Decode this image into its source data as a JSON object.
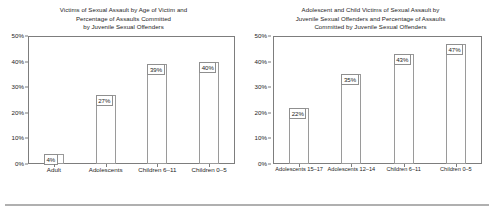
{
  "charts": [
    {
      "id": "left",
      "title": "Victims of Sexual Assault by Age of Victim and Percentage of Assaults Committed by Juvenile Sexual Offenders",
      "title_lines": [
        "Victims of Sexual Assault by Age of Victim and",
        "Percentage of Assaults Committed",
        "by Juvenile Sexual Offenders"
      ],
      "y_ticks": [
        "50%",
        "40%",
        "30%",
        "20%",
        "10%",
        "0%"
      ],
      "categories": [
        "Adult",
        "Adolescents",
        "Children 6–11",
        "Children 0–5"
      ],
      "values": [
        4,
        27,
        39,
        40
      ],
      "value_labels": [
        "4%",
        "27%",
        "39%",
        "40%"
      ]
    },
    {
      "id": "right",
      "title": "Adolescent and Child Victims of Sexual Assault by Juvenile Sexual Offenders and Percentage of Assaults Committed by Juvenile Sexual Offenders",
      "title_lines": [
        "Adolescent and Child Victims of Sexual Assault by",
        "Juvenile Sexual Offenders and Percentage of Assaults",
        "Committed by Juvenile Sexual Offenders"
      ],
      "y_ticks": [
        "50%",
        "40%",
        "30%",
        "20%",
        "10%",
        "0%"
      ],
      "categories": [
        "Adolescents 15–17",
        "Adolescents 12–14",
        "Children 6–11",
        "Children 0–5"
      ],
      "values": [
        22,
        35,
        43,
        47
      ],
      "value_labels": [
        "22%",
        "35%",
        "43%",
        "47%"
      ]
    }
  ],
  "chart_data": [
    {
      "type": "bar",
      "title": "Victims of Sexual Assault by Age of Victim and Percentage of Assaults Committed by Juvenile Sexual Offenders",
      "categories": [
        "Adult",
        "Adolescents",
        "Children 6–11",
        "Children 0–5"
      ],
      "values": [
        4,
        27,
        39,
        40
      ],
      "xlabel": "",
      "ylabel": "",
      "ylim": [
        0,
        50
      ],
      "ytick_step": 10,
      "ytick_labels": [
        "0%",
        "10%",
        "20%",
        "30%",
        "40%",
        "50%"
      ],
      "grid": false,
      "legend": "none",
      "data_labels": [
        "4%",
        "27%",
        "39%",
        "40%"
      ],
      "bar_fill": "#ffffff",
      "bar_border": "#9a9a9a"
    },
    {
      "type": "bar",
      "title": "Adolescent and Child Victims of Sexual Assault by Juvenile Sexual Offenders and Percentage of Assaults Committed by Juvenile Sexual Offenders",
      "categories": [
        "Adolescents 15–17",
        "Adolescents 12–14",
        "Children 6–11",
        "Children 0–5"
      ],
      "values": [
        22,
        35,
        43,
        47
      ],
      "xlabel": "",
      "ylabel": "",
      "ylim": [
        0,
        50
      ],
      "ytick_step": 10,
      "ytick_labels": [
        "0%",
        "10%",
        "20%",
        "30%",
        "40%",
        "50%"
      ],
      "grid": false,
      "legend": "none",
      "data_labels": [
        "22%",
        "35%",
        "43%",
        "47%"
      ],
      "bar_fill": "#ffffff",
      "bar_border": "#9a9a9a"
    }
  ]
}
